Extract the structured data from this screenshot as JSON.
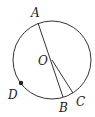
{
  "diagram": {
    "type": "circle-geometry",
    "circle": {
      "center_label": "O",
      "cx": 52,
      "cy": 60,
      "r": 39
    },
    "points": [
      {
        "name": "A",
        "x": 38,
        "y": 23,
        "label_x": 31,
        "label_y": 17
      },
      {
        "name": "B",
        "x": 63,
        "y": 97,
        "label_x": 59,
        "label_y": 112
      },
      {
        "name": "C",
        "x": 73,
        "y": 93,
        "label_x": 76,
        "label_y": 106
      },
      {
        "name": "D",
        "x": 21,
        "y": 83,
        "label_x": 8,
        "label_y": 99,
        "marked": true
      },
      {
        "name": "O",
        "x": 52,
        "y": 60,
        "label_x": 38,
        "label_y": 65
      }
    ],
    "segments": [
      {
        "from": "A",
        "to": "B"
      },
      {
        "from": "O",
        "to": "C"
      }
    ],
    "labels": {
      "A": "A",
      "B": "B",
      "C": "C",
      "D": "D",
      "O": "O"
    }
  }
}
